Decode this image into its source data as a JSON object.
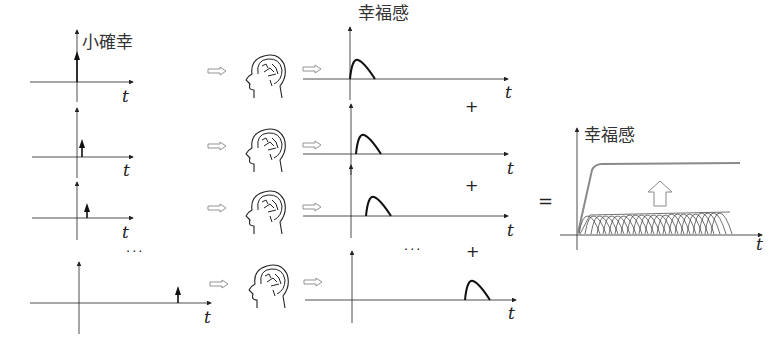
{
  "labels": {
    "input_axis": "小確幸",
    "output_axis": "幸福感",
    "sum_axis": "幸福感",
    "time": "t",
    "plus": "+",
    "equals": "=",
    "ellipsis": "···"
  },
  "rows": [
    {
      "impulse_offset": 0,
      "response_offset": 0,
      "plus_after": true
    },
    {
      "impulse_offset": 6,
      "response_offset": 6,
      "plus_after": true
    },
    {
      "impulse_offset": 12,
      "response_offset": 16,
      "plus_after": true
    },
    {
      "impulse_offset": 100,
      "response_offset": 113,
      "plus_after": false
    }
  ],
  "icons": {
    "head": "brain-head-icon",
    "arrow": "hollow-right-arrow-icon",
    "up_arrow": "hollow-up-arrow-icon"
  },
  "colors": {
    "stroke": "#222222",
    "summed_curve": "#8a8a8a",
    "text": "#333333"
  }
}
